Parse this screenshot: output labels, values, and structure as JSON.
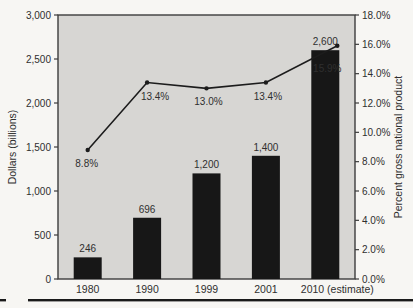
{
  "chart_data": {
    "type": "bar",
    "subtype": "bar+line combo, dual axis",
    "categories": [
      "1980",
      "1990",
      "1999",
      "2001",
      "2010 (estimate)"
    ],
    "series": [
      {
        "name": "Dollars (billions)",
        "type": "bar",
        "axis": "left",
        "values": [
          246,
          696,
          1200,
          1400,
          2600
        ],
        "value_labels": [
          "246",
          "696",
          "1,200",
          "1,400",
          "2,600"
        ],
        "color": "#171717"
      },
      {
        "name": "Percent gross national product",
        "type": "line",
        "axis": "right",
        "values": [
          8.8,
          13.4,
          13.0,
          13.4,
          15.9
        ],
        "value_labels": [
          "8.8%",
          "13.4%",
          "13.0%",
          "13.4%",
          "15.9%"
        ],
        "color": "#1c1c1c",
        "point_label_layout": [
          {
            "dx": -1,
            "dy": 17,
            "px": 0,
            "color": "#2f2f2f"
          },
          {
            "dx": 8,
            "dy": 18,
            "px": 0,
            "color": "#2f2f2f"
          },
          {
            "dx": 2,
            "dy": 17,
            "px": 0,
            "color": "#2f2f2f"
          },
          {
            "dx": 2,
            "dy": 18,
            "px": 0,
            "color": "#2f2f2f"
          },
          {
            "dx": -10,
            "dy": 26,
            "px": 12,
            "color": "#ffffff"
          }
        ]
      }
    ],
    "left_axis": {
      "label": "Dollars (billions)",
      "min": 0,
      "max": 3000,
      "step": 500,
      "tick_labels": [
        "0",
        "500",
        "1,000",
        "1,500",
        "2,000",
        "2,500",
        "3,000"
      ]
    },
    "right_axis": {
      "label": "Percent gross national product",
      "min": 0,
      "max": 18,
      "step": 2,
      "tick_labels": [
        "0.0%",
        "2.0%",
        "4.0%",
        "6.0%",
        "8.0%",
        "10.0%",
        "12.0%",
        "14.0%",
        "16.0%",
        "18.0%"
      ]
    },
    "legend": "none",
    "grid": "off",
    "plot_background": "#d7d6d3",
    "page_background": "#f7f6f3",
    "axis_color": "#3c3c3c",
    "text_color": "#2f2f2f",
    "bottom_rule_color": "#1a1a1a"
  }
}
